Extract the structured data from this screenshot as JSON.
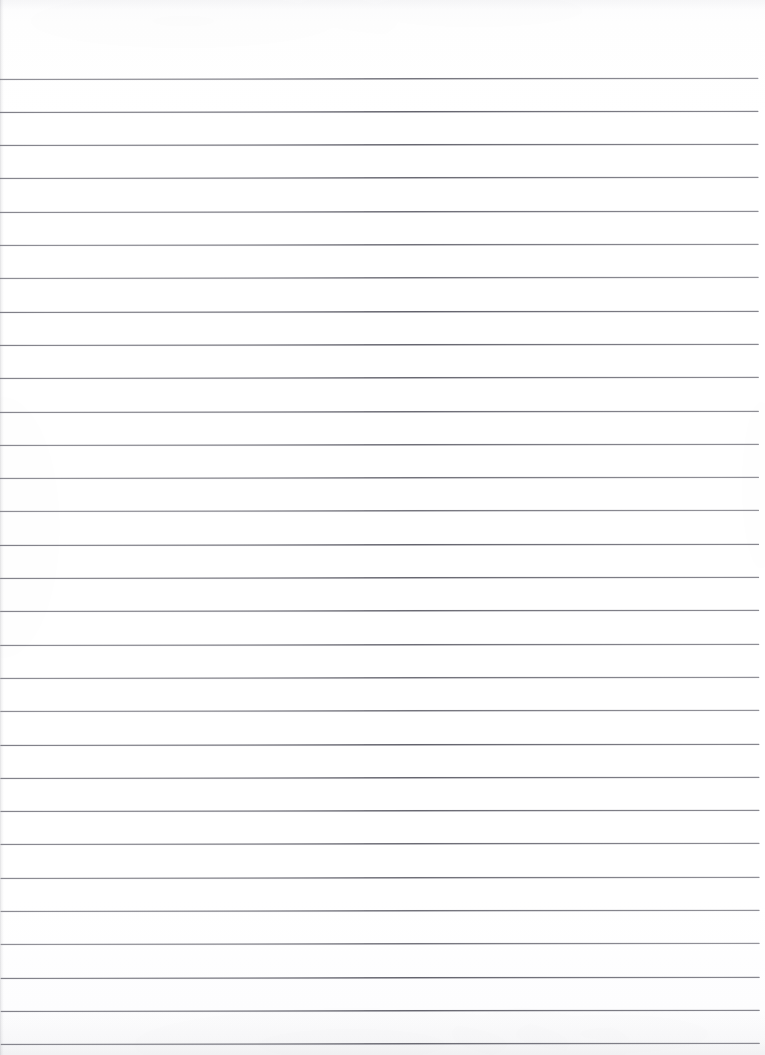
{
  "document": {
    "kind": "scanned-ruled-paper",
    "title": "Blank lined notebook page",
    "description": "A scanned sheet of blank wide-ruled notebook paper with no handwriting, typed text, header, margin rule or page number.",
    "page_width_px": 765,
    "page_height_px": 1055,
    "has_text": false,
    "has_handwriting": false,
    "has_margin_rule": false,
    "has_header": false,
    "has_page_number": false,
    "text_content": ""
  },
  "paper": {
    "background_color": "#fefefe",
    "tint_note": "near-white scanned stock with faint warm-gray mottling",
    "edge_artifact_left": true,
    "edge_artifact_top": true,
    "edge_artifact_bottom": true
  },
  "ruling": {
    "line_color": "#5c5c66",
    "line_color_soft": "#6a6a72",
    "line_thickness_px": 1,
    "line_spacing_px": 33.3,
    "first_line_y_px": 78,
    "line_start_x_px": 0,
    "line_end_x_px": 759,
    "right_margin_px": 6,
    "skew_degrees": -0.085,
    "line_count": 30,
    "line_y_positions": [
      78,
      111.3,
      144.6,
      177.9,
      211.2,
      244.5,
      277.8,
      311.1,
      344.4,
      377.7,
      411.0,
      444.3,
      477.6,
      510.9,
      544.2,
      577.5,
      610.8,
      644.1,
      677.4,
      710.7,
      744.0,
      777.3,
      810.6,
      843.9,
      877.2,
      910.5,
      943.8,
      977.1,
      1010.4,
      1043.7
    ]
  }
}
